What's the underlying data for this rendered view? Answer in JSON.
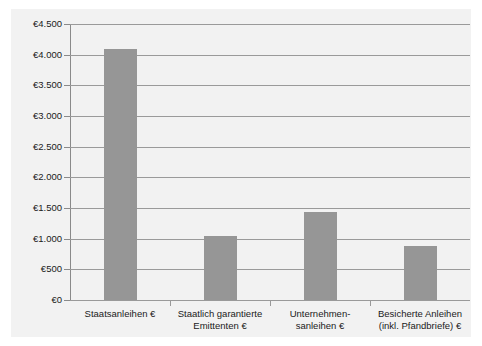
{
  "chart_data": {
    "type": "bar",
    "title": "",
    "subtitle": "",
    "xlabel": "",
    "ylabel": "",
    "categories": [
      "Staatsanleihen €",
      "Staatlich garantierte Emittenten €",
      "Unternehmen-sanleihen €",
      "Besicherte Anleihen (inkl. Pfandbriefe) €"
    ],
    "category_lines": [
      [
        "Staatsanleihen €"
      ],
      [
        "Staatlich garantierte",
        "Emittenten €"
      ],
      [
        "Unternehmen-",
        "sanleihen €"
      ],
      [
        "Besicherte Anleihen",
        "(inkl. Pfandbriefe) €"
      ]
    ],
    "values": [
      4100,
      1040,
      1430,
      880
    ],
    "ylim": [
      0,
      4500
    ],
    "ytick_values": [
      0,
      500,
      1000,
      1500,
      2000,
      2500,
      3000,
      3500,
      4000,
      4500
    ],
    "ytick_labels": [
      "€0",
      "€500",
      "€1.000",
      "€1.500",
      "€2.000",
      "€2.500",
      "€3.000",
      "€3.500",
      "€4.000",
      "€4.500"
    ],
    "grid": true,
    "legend": false,
    "legend_position": "none",
    "colors": {
      "bar": "#969696",
      "grid": "#9a9a9a",
      "axis": "#8a8a8a",
      "panel_background": "#f2f2f2",
      "figure_background": "#ffffff",
      "text": "#1a1a1a"
    }
  }
}
